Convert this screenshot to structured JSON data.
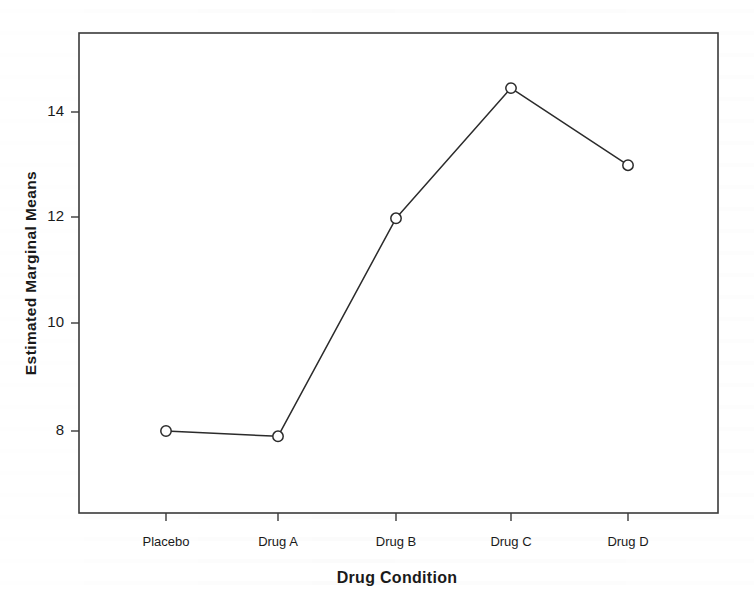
{
  "chart_data": {
    "type": "line",
    "title": "",
    "subtitle": "",
    "xlabel": "Drug Condition",
    "ylabel": "Estimated Marginal Means",
    "categories": [
      "Placebo",
      "Drug A",
      "Drug B",
      "Drug C",
      "Drug D"
    ],
    "values": [
      8.0,
      7.9,
      12.0,
      14.45,
      13.0
    ],
    "series": [
      {
        "name": "Estimated Marginal Means",
        "values": [
          8.0,
          7.9,
          12.0,
          14.45,
          13.0
        ]
      }
    ],
    "ytick_labels": [
      "8",
      "10",
      "12",
      "14"
    ],
    "ytick_values": [
      8,
      10,
      12,
      14
    ],
    "ylim": [
      6.5,
      15.2
    ],
    "grid": false,
    "legend": "none",
    "marker": "open-circle",
    "line_color": "#2b2b2b",
    "marker_color": "#2b2b2b",
    "frame_color": "#3a3a3a",
    "background_color": "#ffffff"
  },
  "axes": {
    "y_title": "Estimated Marginal Means",
    "x_title": "Drug Condition",
    "y_ticks": [
      {
        "label": "14",
        "value": 14
      },
      {
        "label": "12",
        "value": 12
      },
      {
        "label": "10",
        "value": 10
      },
      {
        "label": "8",
        "value": 8
      }
    ],
    "x_ticks": [
      {
        "label": "Placebo"
      },
      {
        "label": "Drug A"
      },
      {
        "label": "Drug B"
      },
      {
        "label": "Drug C"
      },
      {
        "label": "Drug D"
      }
    ]
  },
  "points": [
    {
      "category": "Placebo",
      "value": 8.0
    },
    {
      "category": "Drug A",
      "value": 7.9
    },
    {
      "category": "Drug B",
      "value": 12.0
    },
    {
      "category": "Drug C",
      "value": 14.45
    },
    {
      "category": "Drug D",
      "value": 13.0
    }
  ]
}
